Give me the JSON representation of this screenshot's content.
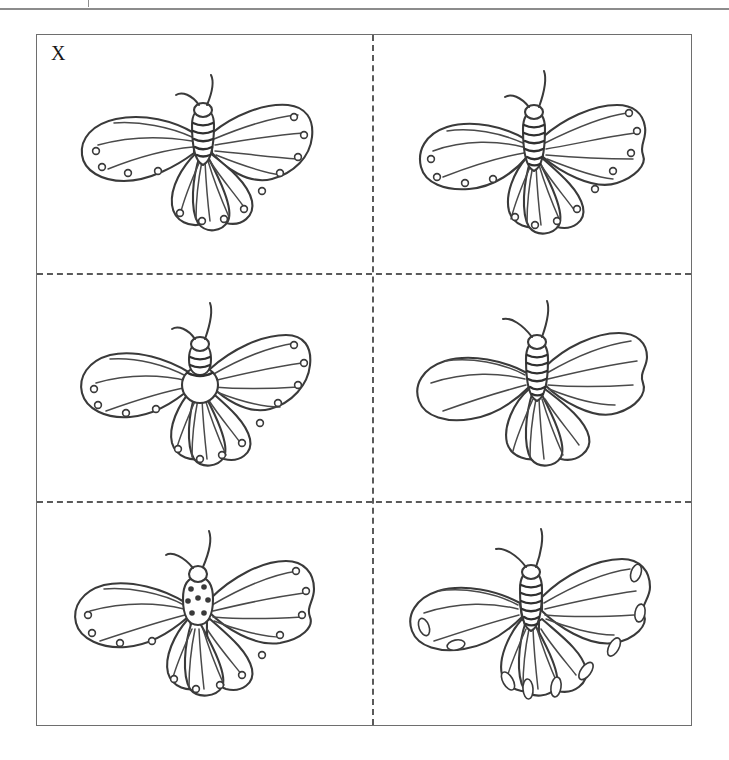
{
  "figure": {
    "panel_label": "X",
    "caption": "",
    "grid": {
      "rows": 3,
      "columns": 2,
      "separator_style": "dashed"
    },
    "frame_border_color": "#6e6e6e",
    "separator_color": "#5a5a5a",
    "ink_color": "#3a3a3a",
    "background_color": "#ffffff"
  },
  "specimens": [
    {
      "position": "top-left",
      "name": "butterfly-1",
      "body_pattern": "striped",
      "wing_markings": "round dots",
      "forewing_shape": "broad angular",
      "antennae": 2
    },
    {
      "position": "top-right",
      "name": "butterfly-2",
      "body_pattern": "striped",
      "wing_markings": "round dots",
      "forewing_shape": "scalloped",
      "antennae": 2
    },
    {
      "position": "middle-left",
      "name": "butterfly-3",
      "body_pattern": "striped with pale round abdomen",
      "wing_markings": "round dots",
      "forewing_shape": "broad angular",
      "antennae": 2
    },
    {
      "position": "middle-right",
      "name": "butterfly-4",
      "body_pattern": "striped",
      "wing_markings": "none",
      "forewing_shape": "scalloped",
      "antennae": 2
    },
    {
      "position": "bottom-left",
      "name": "butterfly-5",
      "body_pattern": "spotted",
      "wing_markings": "round dots",
      "forewing_shape": "broad angular",
      "antennae": 2
    },
    {
      "position": "bottom-right",
      "name": "butterfly-6",
      "body_pattern": "striped",
      "wing_markings": "elongated ovals",
      "forewing_shape": "scalloped",
      "antennae": 2
    }
  ]
}
